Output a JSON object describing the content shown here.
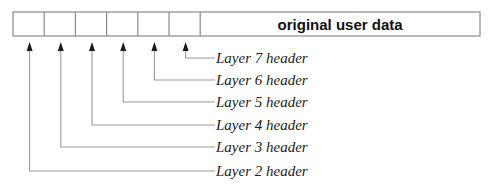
{
  "diagram": {
    "packet": {
      "x": 13,
      "y": 12,
      "width": 467,
      "height": 24,
      "header_cells": 6,
      "cell_width": 31.2,
      "payload_label": "original user data"
    },
    "headers": [
      {
        "label": "Layer 7 header",
        "cell_index": 5,
        "label_y": 58
      },
      {
        "label": "Layer 6 header",
        "cell_index": 4,
        "label_y": 80
      },
      {
        "label": "Layer 5 header",
        "cell_index": 3,
        "label_y": 102
      },
      {
        "label": "Layer 4 header",
        "cell_index": 2,
        "label_y": 125
      },
      {
        "label": "Layer 3 header",
        "cell_index": 1,
        "label_y": 147
      },
      {
        "label": "Layer 2 header",
        "cell_index": 0,
        "label_y": 171
      }
    ],
    "label_x": 215,
    "colors": {
      "border": "#8a8a8a",
      "leader": "#9a9a9a",
      "arrow": "#1a1a1a",
      "text": "#222222"
    }
  }
}
